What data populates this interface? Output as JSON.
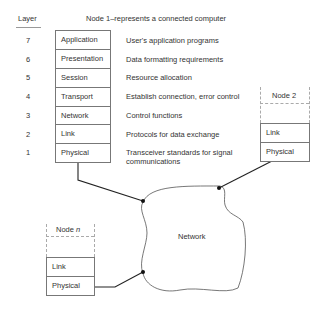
{
  "header": {
    "layer_label": "Layer",
    "node1_title": "Node 1–represents a connected computer"
  },
  "layers": [
    {
      "number": "7",
      "name": "Application",
      "description": "User's application programs"
    },
    {
      "number": "6",
      "name": "Presentation",
      "description": "Data formatting requirements"
    },
    {
      "number": "5",
      "name": "Session",
      "description": "Resource allocation"
    },
    {
      "number": "4",
      "name": "Transport",
      "description": "Establish connection, error control"
    },
    {
      "number": "3",
      "name": "Network",
      "description": "Control functions"
    },
    {
      "number": "2",
      "name": "Link",
      "description": "Protocols for data exchange"
    },
    {
      "number": "1",
      "name": "Physical",
      "description": "Transceiver standards for signal",
      "description_line2": "communications"
    }
  ],
  "node2": {
    "title": "Node 2",
    "layers": [
      "Link",
      "Physical"
    ]
  },
  "noden": {
    "title_prefix": "Node ",
    "title_var": "n",
    "layers": [
      "Link",
      "Physical"
    ]
  },
  "network": {
    "label": "Network"
  },
  "colors": {
    "line": "#222222",
    "box_border": "#777777",
    "dashed": "#aaaaaa",
    "text": "#333333"
  }
}
